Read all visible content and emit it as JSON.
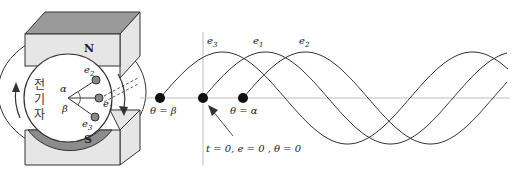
{
  "figure": {
    "generator": {
      "north_pole_label": "N",
      "south_pole_label": "S",
      "armature_label_lines": [
        "전",
        "기",
        "자"
      ],
      "coil_labels": {
        "e1": "e",
        "e2": "e",
        "e3": "e"
      },
      "coil_subscripts": {
        "e1": "1",
        "e2": "2",
        "e3": "3"
      },
      "angle_labels": {
        "alpha": "α",
        "beta": "β"
      }
    },
    "waveform": {
      "wave_labels": [
        {
          "name": "e",
          "sub": "3"
        },
        {
          "name": "e",
          "sub": "1"
        },
        {
          "name": "e",
          "sub": "2"
        }
      ],
      "point_labels": {
        "beta": "θ = β",
        "alpha": "θ = α",
        "origin": "t = 0,  e = 0 ,  θ = 0"
      }
    },
    "colors": {
      "magnet_face": "#e6e6e6",
      "magnet_top": "#9a9a9a",
      "pole_arc": "#8c8c8c",
      "line": "#333333",
      "axis": "#bdbdbd"
    }
  }
}
